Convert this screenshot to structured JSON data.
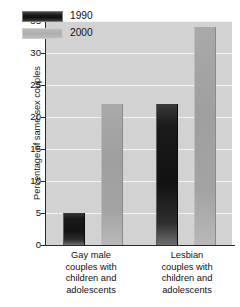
{
  "chart_data": {
    "type": "bar",
    "title": "",
    "subtitle": "",
    "xlabel": "",
    "ylabel": "Percentage of same-sex couples",
    "ylim": [
      0,
      35
    ],
    "yticks": [
      0,
      5,
      10,
      15,
      20,
      25,
      30,
      35
    ],
    "ytick_labels": [
      "0",
      "5",
      "10",
      "15",
      "20",
      "25",
      "30",
      "35"
    ],
    "grid": "horizontal",
    "legend_position": "top-left-inside",
    "categories": [
      "Gay male couples with children and adolescents",
      "Lesbian couples with children and adolescents"
    ],
    "category_lines": [
      [
        "Gay male",
        "couples with",
        "children and",
        "adolescents"
      ],
      [
        "Lesbian",
        "couples with",
        "children and",
        "adolescents"
      ]
    ],
    "series": [
      {
        "name": "1990",
        "color": "#1a1a1a",
        "values": [
          5,
          22
        ]
      },
      {
        "name": "2000",
        "color": "#a6a6a6",
        "values": [
          22,
          34
        ]
      }
    ],
    "annotations": [],
    "plot_background": "#d2d2d2",
    "gridline_color": "#f4f4f4",
    "axis_color": "#2a2a2a"
  }
}
